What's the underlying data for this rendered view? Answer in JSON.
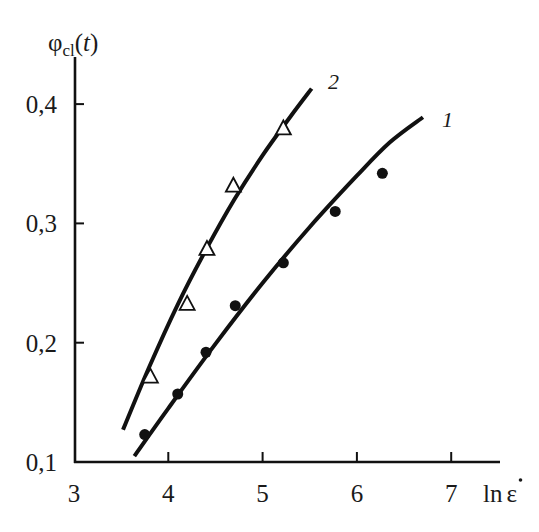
{
  "chart_data": {
    "type": "scatter",
    "title": "",
    "xlabel": "ln ε̇",
    "ylabel": "φcl(t)",
    "ylabel_parts": {
      "symbol": "φ",
      "subscript": "cl",
      "arg_open": "(",
      "arg": "t",
      "arg_close": ")"
    },
    "xlabel_parts": {
      "ln": "ln",
      "symbol": "ε"
    },
    "xlim": [
      3,
      7.5
    ],
    "ylim": [
      0.1,
      0.44
    ],
    "x_ticks": [
      3,
      4,
      5,
      6,
      7
    ],
    "x_tick_labels": [
      "3",
      "4",
      "5",
      "6",
      "7"
    ],
    "y_ticks": [
      0.1,
      0.2,
      0.3,
      0.4
    ],
    "y_tick_labels": [
      "0,1",
      "0,2",
      "0,3",
      "0,4"
    ],
    "grid": false,
    "legend": "curve labels placed at line ends",
    "series": [
      {
        "name": "1",
        "marker": "filled-circle",
        "x": [
          3.75,
          4.1,
          4.4,
          4.71,
          5.22,
          5.77,
          6.27
        ],
        "y": [
          0.123,
          0.157,
          0.192,
          0.231,
          0.267,
          0.31,
          0.342
        ],
        "fit_curve": {
          "x": [
            3.64,
            4.0,
            4.5,
            5.0,
            5.5,
            6.0,
            6.35,
            6.7
          ],
          "y": [
            0.105,
            0.145,
            0.199,
            0.25,
            0.297,
            0.34,
            0.368,
            0.389
          ]
        }
      },
      {
        "name": "2",
        "marker": "open-triangle",
        "x": [
          3.81,
          4.2,
          4.41,
          4.69,
          5.22
        ],
        "y": [
          0.172,
          0.233,
          0.279,
          0.332,
          0.38
        ],
        "fit_curve": {
          "x": [
            3.52,
            3.8,
            4.1,
            4.4,
            4.7,
            5.0,
            5.3,
            5.52
          ],
          "y": [
            0.127,
            0.18,
            0.232,
            0.278,
            0.32,
            0.357,
            0.39,
            0.413
          ]
        }
      }
    ]
  },
  "caption_visible_fragment": ""
}
